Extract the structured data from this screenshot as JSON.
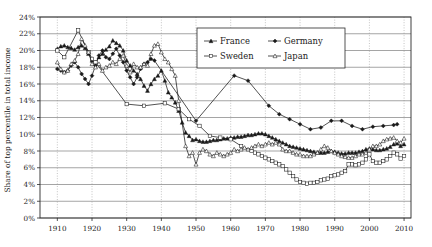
{
  "chart_data": {
    "type": "line",
    "title": "",
    "xlabel": "",
    "ylabel": "Share of top percentile in total income",
    "xlim": [
      1905,
      2012
    ],
    "ylim": [
      0,
      24
    ],
    "grid": true,
    "legend_position": "top-right",
    "y_ticks": [
      "0%",
      "2%",
      "4%",
      "6%",
      "8%",
      "10%",
      "12%",
      "14%",
      "16%",
      "18%",
      "20%",
      "22%",
      "24%"
    ],
    "y_tick_values": [
      0,
      2,
      4,
      6,
      8,
      10,
      12,
      14,
      16,
      18,
      20,
      22,
      24
    ],
    "x_ticks": [
      "1910",
      "1920",
      "1930",
      "1940",
      "1950",
      "1960",
      "1970",
      "1980",
      "1990",
      "2000",
      "2010"
    ],
    "x_tick_values": [
      1910,
      1920,
      1930,
      1940,
      1950,
      1960,
      1970,
      1980,
      1990,
      2000,
      2010
    ],
    "series": [
      {
        "name": "France",
        "marker": "filled-triangle",
        "color": "#1a1a1a",
        "x": [
          1910,
          1911,
          1912,
          1913,
          1914,
          1915,
          1916,
          1917,
          1918,
          1919,
          1920,
          1921,
          1922,
          1923,
          1924,
          1925,
          1926,
          1927,
          1928,
          1929,
          1930,
          1931,
          1932,
          1933,
          1934,
          1935,
          1936,
          1937,
          1938,
          1939,
          1940,
          1941,
          1942,
          1943,
          1944,
          1945,
          1946,
          1947,
          1948,
          1949,
          1950,
          1951,
          1952,
          1953,
          1954,
          1955,
          1956,
          1957,
          1958,
          1959,
          1960,
          1961,
          1962,
          1963,
          1964,
          1965,
          1966,
          1967,
          1968,
          1969,
          1970,
          1971,
          1972,
          1973,
          1974,
          1975,
          1976,
          1977,
          1978,
          1979,
          1980,
          1981,
          1982,
          1983,
          1984,
          1985,
          1986,
          1987,
          1988,
          1989,
          1990,
          1991,
          1992,
          1993,
          1994,
          1995,
          1996,
          1997,
          1998,
          1999,
          2000,
          2001,
          2002,
          2003,
          2004,
          2005,
          2006,
          2007,
          2008,
          2009,
          2010
        ],
        "y": [
          20.2,
          20.5,
          20.6,
          20.4,
          20.3,
          20.1,
          20.4,
          20.6,
          20.3,
          19.6,
          18.8,
          18.6,
          19.2,
          19.6,
          20.1,
          20.5,
          21.2,
          20.9,
          20.6,
          20.0,
          18.8,
          18.2,
          17.6,
          17.2,
          16.6,
          15.8,
          15.2,
          16.0,
          16.6,
          17.0,
          17.6,
          16.4,
          15.0,
          14.4,
          13.8,
          12.8,
          11.4,
          10.2,
          9.8,
          9.3,
          9.4,
          9.2,
          9.1,
          9.1,
          9.2,
          9.3,
          9.3,
          9.4,
          9.5,
          9.5,
          9.6,
          9.6,
          9.7,
          9.7,
          9.8,
          9.9,
          9.9,
          10.0,
          10.1,
          10.1,
          10.0,
          9.8,
          9.6,
          9.4,
          9.2,
          9.0,
          8.8,
          8.6,
          8.5,
          8.4,
          8.3,
          8.2,
          8.1,
          8.0,
          7.9,
          7.8,
          7.8,
          7.8,
          7.9,
          8.0,
          7.9,
          7.8,
          7.7,
          7.7,
          7.8,
          7.8,
          7.8,
          7.9,
          8.0,
          8.2,
          8.3,
          8.2,
          8.1,
          8.1,
          8.2,
          8.3,
          8.5,
          8.8,
          8.9,
          8.6,
          8.8
        ]
      },
      {
        "name": "Germany",
        "marker": "filled-diamond",
        "color": "#1a1a1a",
        "x": [
          1910,
          1911,
          1912,
          1913,
          1914,
          1915,
          1916,
          1917,
          1918,
          1919,
          1920,
          1921,
          1922,
          1923,
          1924,
          1925,
          1926,
          1927,
          1928,
          1929,
          1930,
          1931,
          1932,
          1933,
          1934,
          1935,
          1936,
          1937,
          1938,
          1950,
          1961,
          1965,
          1971,
          1974,
          1977,
          1980,
          1983,
          1986,
          1989,
          1992,
          1995,
          1998,
          2001,
          2004,
          2007,
          2008
        ],
        "y": [
          17.8,
          17.6,
          17.4,
          17.6,
          18.2,
          18.6,
          18.0,
          17.2,
          16.6,
          16.0,
          17.0,
          18.2,
          19.4,
          20.0,
          19.2,
          19.0,
          19.6,
          20.2,
          19.4,
          18.6,
          17.6,
          16.8,
          16.0,
          16.8,
          17.8,
          18.4,
          18.6,
          19.0,
          18.8,
          11.6,
          17.0,
          16.4,
          13.4,
          12.4,
          11.8,
          11.2,
          10.6,
          10.8,
          11.6,
          11.6,
          11.0,
          10.6,
          10.9,
          11.0,
          11.1,
          11.2
        ]
      },
      {
        "name": "Sweden",
        "marker": "open-square",
        "color": "#1a1a1a",
        "x": [
          1910,
          1912,
          1916,
          1919,
          1920,
          1921,
          1930,
          1935,
          1941,
          1945,
          1948,
          1951,
          1954,
          1957,
          1960,
          1963,
          1966,
          1967,
          1968,
          1969,
          1970,
          1971,
          1972,
          1973,
          1974,
          1975,
          1976,
          1977,
          1978,
          1979,
          1980,
          1981,
          1982,
          1983,
          1984,
          1985,
          1986,
          1987,
          1988,
          1989,
          1990,
          1991,
          1992,
          1993,
          1994,
          1995,
          1996,
          1997,
          1998,
          1999,
          2000,
          2001,
          2002,
          2003,
          2004,
          2005,
          2006,
          2007,
          2008,
          2009,
          2010
        ],
        "y": [
          20.0,
          19.2,
          22.4,
          19.8,
          19.0,
          18.6,
          13.6,
          13.4,
          13.7,
          13.0,
          11.8,
          11.0,
          9.8,
          9.6,
          9.4,
          8.6,
          8.0,
          7.8,
          7.6,
          7.4,
          7.2,
          7.0,
          6.8,
          6.6,
          6.4,
          6.2,
          5.8,
          5.4,
          5.0,
          4.6,
          4.3,
          4.2,
          4.1,
          4.2,
          4.2,
          4.3,
          4.5,
          4.6,
          4.7,
          5.0,
          5.1,
          5.2,
          5.4,
          5.6,
          6.4,
          6.4,
          6.3,
          6.4,
          6.6,
          7.0,
          7.6,
          6.8,
          6.6,
          6.6,
          6.8,
          7.0,
          7.4,
          7.8,
          7.6,
          7.1,
          7.4
        ]
      },
      {
        "name": "Japan",
        "marker": "open-triangle",
        "color": "#1a1a1a",
        "x": [
          1910,
          1911,
          1912,
          1913,
          1914,
          1915,
          1916,
          1917,
          1918,
          1919,
          1920,
          1921,
          1922,
          1923,
          1924,
          1925,
          1926,
          1927,
          1928,
          1929,
          1930,
          1931,
          1932,
          1933,
          1934,
          1935,
          1936,
          1937,
          1938,
          1939,
          1940,
          1941,
          1942,
          1943,
          1944,
          1945,
          1947,
          1948,
          1949,
          1950,
          1951,
          1952,
          1953,
          1954,
          1955,
          1956,
          1957,
          1958,
          1959,
          1960,
          1961,
          1962,
          1963,
          1964,
          1965,
          1966,
          1967,
          1968,
          1969,
          1970,
          1971,
          1972,
          1973,
          1974,
          1975,
          1976,
          1977,
          1978,
          1979,
          1980,
          1981,
          1982,
          1983,
          1984,
          1985,
          1986,
          1987,
          1988,
          1989,
          1990,
          1991,
          1992,
          1993,
          1994,
          1995,
          1996,
          1997,
          1998,
          1999,
          2000,
          2001,
          2002,
          2003,
          2004,
          2005,
          2006,
          2007,
          2008,
          2009,
          2010
        ],
        "y": [
          18.6,
          17.8,
          17.4,
          17.6,
          18.4,
          18.8,
          19.6,
          21.4,
          20.6,
          19.8,
          18.4,
          18.0,
          18.4,
          17.6,
          18.0,
          18.2,
          18.6,
          18.4,
          19.0,
          19.4,
          18.2,
          17.4,
          18.4,
          18.0,
          18.0,
          18.4,
          18.2,
          19.6,
          20.6,
          20.8,
          19.8,
          19.0,
          18.6,
          17.8,
          17.0,
          14.0,
          8.6,
          7.4,
          7.8,
          6.4,
          7.8,
          8.2,
          8.0,
          7.6,
          7.4,
          7.8,
          7.6,
          7.4,
          7.6,
          7.8,
          8.2,
          8.0,
          8.2,
          8.4,
          8.2,
          8.4,
          8.6,
          8.8,
          8.6,
          8.8,
          9.0,
          8.8,
          9.0,
          8.8,
          8.2,
          8.0,
          8.0,
          7.8,
          7.6,
          7.6,
          7.4,
          7.4,
          7.4,
          7.6,
          7.8,
          8.2,
          8.6,
          8.4,
          8.0,
          7.8,
          7.6,
          7.4,
          7.3,
          7.2,
          7.2,
          7.4,
          7.6,
          7.6,
          7.8,
          8.2,
          8.6,
          8.6,
          8.8,
          9.2,
          9.4,
          9.5,
          9.6,
          9.2,
          9.0,
          9.5
        ]
      }
    ]
  },
  "legend": {
    "entries": [
      {
        "label": "France",
        "marker": "filled-triangle"
      },
      {
        "label": "Germany",
        "marker": "filled-diamond"
      },
      {
        "label": "Sweden",
        "marker": "open-square"
      },
      {
        "label": "Japan",
        "marker": "open-triangle"
      }
    ]
  }
}
